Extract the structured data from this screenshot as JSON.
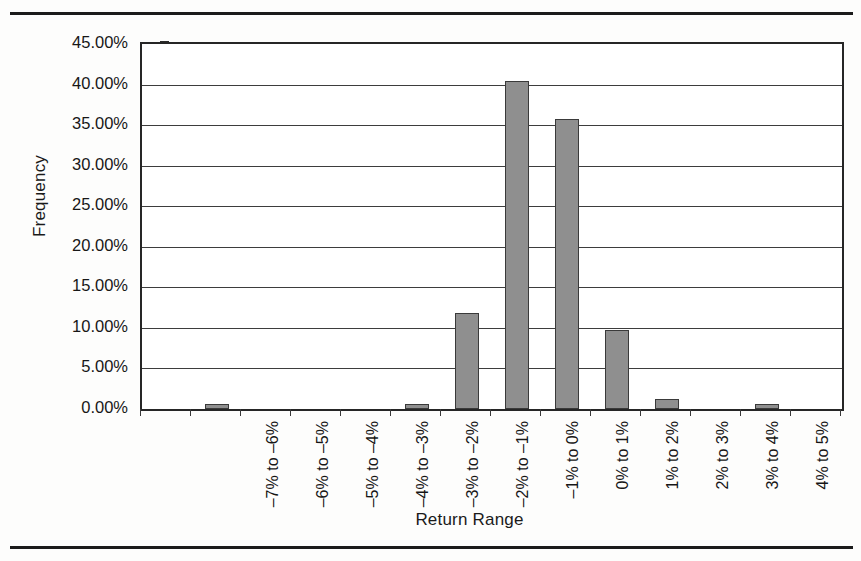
{
  "chart_data": {
    "type": "bar",
    "title": "",
    "xlabel": "Return Range",
    "ylabel": "Frequency",
    "categories": [
      "–7% to –6%",
      "–6% to –5%",
      "–5% to –4%",
      "–4% to –3%",
      "–3% to –2%",
      "–2% to –1%",
      "–1% to 0%",
      "0% to 1%",
      "1% to 2%",
      "2% to 3%",
      "3% to 4%",
      "4% to 5%",
      "5% to 6%",
      "6% to 7%"
    ],
    "values": [
      0.0,
      0.6,
      0.0,
      0.0,
      0.0,
      0.6,
      11.8,
      40.5,
      35.8,
      9.8,
      1.2,
      0.0,
      0.6,
      0.0
    ],
    "value_unit": "percent",
    "ylim": [
      0,
      45
    ],
    "ytick_values": [
      0,
      5,
      10,
      15,
      20,
      25,
      30,
      35,
      40,
      45
    ],
    "ytick_labels": [
      "0.00%",
      "5.00%",
      "10.00%",
      "15.00%",
      "20.00%",
      "25.00%",
      "30.00%",
      "35.00%",
      "40.00%",
      "45.00%"
    ],
    "grid": "horizontal",
    "legend": "none",
    "bar_color": "#8f8f8f",
    "bar_border_color": "#3a3a3a",
    "axis_color": "#262626"
  }
}
